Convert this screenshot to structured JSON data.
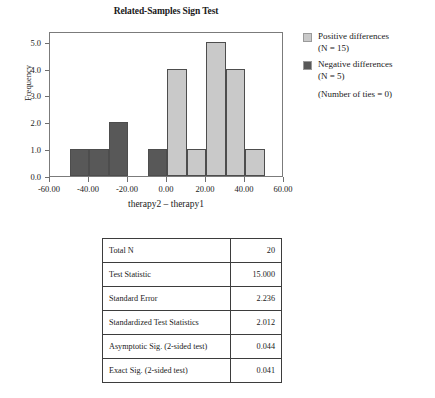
{
  "chart_data": {
    "type": "bar",
    "title": "Related-Samples Sign Test",
    "xlabel": "therapy2 – therapy1",
    "ylabel": "Frequency",
    "xlim": [
      -60,
      60
    ],
    "ylim": [
      0,
      5.4
    ],
    "grid": false,
    "legend_position": "right",
    "bin_width": 10,
    "x_ticks": [
      "-60.00",
      "-40.00",
      "-20.00",
      "0.00",
      "20.00",
      "40.00",
      "60.00"
    ],
    "x_tick_values": [
      -60,
      -40,
      -20,
      0,
      20,
      40,
      60
    ],
    "y_ticks": [
      "0.0",
      "1.0",
      "2.0",
      "3.0",
      "4.0",
      "5.0"
    ],
    "y_tick_values": [
      0,
      1,
      2,
      3,
      4,
      5
    ],
    "bins": [
      {
        "x0": -50,
        "x1": -40,
        "value": 1,
        "group": "negative"
      },
      {
        "x0": -40,
        "x1": -30,
        "value": 1,
        "group": "negative"
      },
      {
        "x0": -30,
        "x1": -20,
        "value": 2,
        "group": "negative"
      },
      {
        "x0": -10,
        "x1": 0,
        "value": 1,
        "group": "negative"
      },
      {
        "x0": 0,
        "x1": 10,
        "value": 4,
        "group": "positive"
      },
      {
        "x0": 10,
        "x1": 20,
        "value": 1,
        "group": "positive"
      },
      {
        "x0": 20,
        "x1": 30,
        "value": 5,
        "group": "positive"
      },
      {
        "x0": 30,
        "x1": 40,
        "value": 4,
        "group": "positive"
      },
      {
        "x0": 40,
        "x1": 50,
        "value": 1,
        "group": "positive"
      }
    ],
    "series": [
      {
        "name": "Positive differences",
        "color": "#c9c9c9",
        "n": 15
      },
      {
        "name": "Negative differences",
        "color": "#585858",
        "n": 5
      }
    ],
    "annotations": [
      "(Number of ties = 0)"
    ]
  },
  "legend": {
    "positive": {
      "label": "Positive differences",
      "n_text": "(N = 15)"
    },
    "negative": {
      "label": "Negative differences",
      "n_text": "(N = 5)"
    },
    "ties_text": "(Number of ties = 0)"
  },
  "stats_table": {
    "rows": [
      {
        "label": "Total N",
        "value": "20"
      },
      {
        "label": "Test Statistic",
        "value": "15.000"
      },
      {
        "label": "Standard Error",
        "value": "2.236"
      },
      {
        "label": "Standardized Test Statistics",
        "value": "2.012"
      },
      {
        "label": "Asymptotic Sig. (2-sided test)",
        "value": "0.044"
      },
      {
        "label": "Exact Sig. (2-sided test)",
        "value": "0.041"
      }
    ]
  },
  "colors": {
    "positive": "#c9c9c9",
    "negative": "#585858",
    "frame": "#7b7b7b",
    "text": "#1a1a1a"
  }
}
